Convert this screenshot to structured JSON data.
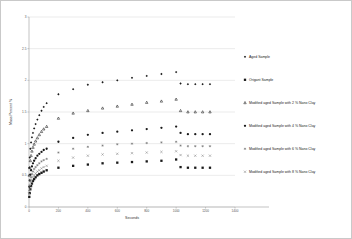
{
  "chart_data": {
    "type": "scatter",
    "title": "",
    "xlabel": "Seconds",
    "ylabel": "Mass Percent %",
    "xlim": [
      0,
      1400
    ],
    "ylim": [
      0,
      3
    ],
    "xticks": [
      0,
      200,
      400,
      600,
      800,
      1000,
      1200,
      1400
    ],
    "xticklabels": [
      "0",
      "200",
      "400",
      "600",
      "800",
      "1000",
      "1200",
      "1400"
    ],
    "yticks": [
      0,
      0.5,
      1,
      1.5,
      2,
      2.5,
      3
    ],
    "yticklabels": [
      "0",
      "0.5",
      "1",
      "1.5",
      "2",
      "2.5",
      "3"
    ],
    "grid": true,
    "legend_position": "right",
    "series": [
      {
        "name": "Aged Sample",
        "marker": "diamond",
        "color": "#1a1a1a",
        "points": [
          [
            2,
            0.62
          ],
          [
            5,
            0.78
          ],
          [
            9,
            0.92
          ],
          [
            14,
            1.02
          ],
          [
            20,
            1.1
          ],
          [
            27,
            1.17
          ],
          [
            35,
            1.24
          ],
          [
            45,
            1.31
          ],
          [
            57,
            1.38
          ],
          [
            70,
            1.45
          ],
          [
            85,
            1.52
          ],
          [
            100,
            1.58
          ],
          [
            120,
            1.64
          ],
          [
            200,
            1.78
          ],
          [
            300,
            1.86
          ],
          [
            400,
            1.93
          ],
          [
            500,
            1.97
          ],
          [
            600,
            2.0
          ],
          [
            700,
            2.04
          ],
          [
            800,
            2.07
          ],
          [
            900,
            2.1
          ],
          [
            1000,
            2.13
          ],
          [
            1030,
            1.95
          ],
          [
            1080,
            1.94
          ],
          [
            1130,
            1.94
          ],
          [
            1180,
            1.94
          ],
          [
            1230,
            1.94
          ]
        ]
      },
      {
        "name": "Origant Sample",
        "marker": "square",
        "color": "#1a1a1a",
        "points": [
          [
            2,
            0.16
          ],
          [
            5,
            0.22
          ],
          [
            9,
            0.28
          ],
          [
            14,
            0.33
          ],
          [
            20,
            0.37
          ],
          [
            27,
            0.41
          ],
          [
            35,
            0.44
          ],
          [
            45,
            0.47
          ],
          [
            57,
            0.5
          ],
          [
            70,
            0.52
          ],
          [
            85,
            0.54
          ],
          [
            100,
            0.56
          ],
          [
            120,
            0.58
          ],
          [
            200,
            0.62
          ],
          [
            300,
            0.65
          ],
          [
            400,
            0.67
          ],
          [
            500,
            0.69
          ],
          [
            600,
            0.7
          ],
          [
            700,
            0.71
          ],
          [
            800,
            0.72
          ],
          [
            900,
            0.73
          ],
          [
            1000,
            0.75
          ],
          [
            1030,
            0.63
          ],
          [
            1080,
            0.62
          ],
          [
            1130,
            0.62
          ],
          [
            1180,
            0.62
          ],
          [
            1230,
            0.62
          ]
        ]
      },
      {
        "name": "Modified aged Sample with 2 % Nano Clay",
        "marker": "triangle",
        "color": "#1a1a1a",
        "points": [
          [
            2,
            0.5
          ],
          [
            5,
            0.62
          ],
          [
            9,
            0.73
          ],
          [
            14,
            0.81
          ],
          [
            20,
            0.88
          ],
          [
            27,
            0.94
          ],
          [
            35,
            0.99
          ],
          [
            45,
            1.04
          ],
          [
            57,
            1.09
          ],
          [
            70,
            1.14
          ],
          [
            85,
            1.19
          ],
          [
            100,
            1.23
          ],
          [
            120,
            1.27
          ],
          [
            200,
            1.4
          ],
          [
            300,
            1.48
          ],
          [
            400,
            1.52
          ],
          [
            500,
            1.56
          ],
          [
            600,
            1.59
          ],
          [
            700,
            1.62
          ],
          [
            800,
            1.65
          ],
          [
            900,
            1.67
          ],
          [
            1000,
            1.7
          ],
          [
            1030,
            1.52
          ],
          [
            1080,
            1.5
          ],
          [
            1130,
            1.5
          ],
          [
            1180,
            1.5
          ],
          [
            1230,
            1.5
          ]
        ]
      },
      {
        "name": "Modified aged Sample with 4 % Nano Clay",
        "marker": "circle",
        "color": "#1a1a1a",
        "points": [
          [
            2,
            0.32
          ],
          [
            5,
            0.42
          ],
          [
            9,
            0.51
          ],
          [
            14,
            0.58
          ],
          [
            20,
            0.64
          ],
          [
            27,
            0.69
          ],
          [
            35,
            0.73
          ],
          [
            45,
            0.77
          ],
          [
            57,
            0.81
          ],
          [
            70,
            0.84
          ],
          [
            85,
            0.87
          ],
          [
            100,
            0.9
          ],
          [
            120,
            0.92
          ],
          [
            200,
            1.03
          ],
          [
            300,
            1.09
          ],
          [
            400,
            1.14
          ],
          [
            500,
            1.17
          ],
          [
            600,
            1.19
          ],
          [
            700,
            1.21
          ],
          [
            800,
            1.23
          ],
          [
            900,
            1.25
          ],
          [
            1000,
            1.27
          ],
          [
            1030,
            1.17
          ],
          [
            1080,
            1.15
          ],
          [
            1130,
            1.15
          ],
          [
            1180,
            1.15
          ],
          [
            1230,
            1.15
          ]
        ]
      },
      {
        "name": "Modified aged Sample with 6 % Nano Clay",
        "marker": "asterisk",
        "color": "#6f6f6f",
        "points": [
          [
            2,
            0.26
          ],
          [
            5,
            0.34
          ],
          [
            9,
            0.41
          ],
          [
            14,
            0.47
          ],
          [
            20,
            0.52
          ],
          [
            27,
            0.56
          ],
          [
            35,
            0.6
          ],
          [
            45,
            0.63
          ],
          [
            57,
            0.66
          ],
          [
            70,
            0.69
          ],
          [
            85,
            0.72
          ],
          [
            100,
            0.74
          ],
          [
            120,
            0.76
          ],
          [
            200,
            0.86
          ],
          [
            300,
            0.92
          ],
          [
            400,
            0.95
          ],
          [
            500,
            0.97
          ],
          [
            600,
            0.99
          ],
          [
            700,
            1.0
          ],
          [
            800,
            1.01
          ],
          [
            900,
            1.02
          ],
          [
            1000,
            1.03
          ],
          [
            1030,
            0.97
          ],
          [
            1080,
            0.96
          ],
          [
            1130,
            0.96
          ],
          [
            1180,
            0.96
          ],
          [
            1230,
            0.96
          ]
        ]
      },
      {
        "name": "Modified aged Sample with 8 % Nano Clay",
        "marker": "cross",
        "color": "#7a7a7a",
        "points": [
          [
            2,
            0.21
          ],
          [
            5,
            0.28
          ],
          [
            9,
            0.34
          ],
          [
            14,
            0.39
          ],
          [
            20,
            0.43
          ],
          [
            27,
            0.47
          ],
          [
            35,
            0.5
          ],
          [
            45,
            0.53
          ],
          [
            57,
            0.56
          ],
          [
            70,
            0.58
          ],
          [
            85,
            0.61
          ],
          [
            100,
            0.63
          ],
          [
            120,
            0.65
          ],
          [
            200,
            0.73
          ],
          [
            300,
            0.78
          ],
          [
            400,
            0.81
          ],
          [
            500,
            0.83
          ],
          [
            600,
            0.84
          ],
          [
            700,
            0.85
          ],
          [
            800,
            0.86
          ],
          [
            900,
            0.87
          ],
          [
            1000,
            0.88
          ],
          [
            1030,
            0.82
          ],
          [
            1080,
            0.81
          ],
          [
            1130,
            0.81
          ],
          [
            1180,
            0.81
          ],
          [
            1230,
            0.81
          ]
        ]
      }
    ]
  },
  "legend": {
    "items": [
      {
        "label": "Aged Sample",
        "marker": "diamond"
      },
      {
        "label": "Origant Sample",
        "marker": "square"
      },
      {
        "label": "Modified aged Sample with 2 % Nano Clay",
        "marker": "triangle"
      },
      {
        "label": "Modified aged Sample with 4 % Nano Clay",
        "marker": "circle"
      },
      {
        "label": "Modified aged Sample with 6 % Nano Clay",
        "marker": "asterisk"
      },
      {
        "label": "Modified aged Sample with 8 % Nano Clay",
        "marker": "cross"
      }
    ]
  }
}
